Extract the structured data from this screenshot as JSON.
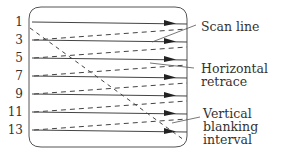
{
  "diagram": {
    "line_numbers": [
      "1",
      "3",
      "5",
      "7",
      "9",
      "11",
      "13"
    ],
    "callouts": {
      "scan_line": "Scan line",
      "horizontal_retrace_1": "Horizontal",
      "horizontal_retrace_2": "retrace",
      "vertical_blanking_1": "Vertical blanking",
      "vertical_blanking_2": "interval"
    },
    "colors": {
      "line": "#444444",
      "text": "#333333",
      "background": "#ffffff"
    }
  }
}
